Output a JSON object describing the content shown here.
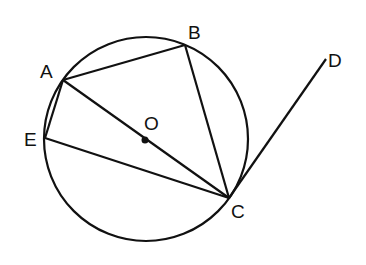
{
  "diagram": {
    "type": "circle-geometry",
    "circle": {
      "center_label": "O",
      "cx": 146,
      "cy": 139,
      "r": 102
    },
    "points": {
      "A": {
        "x": 63,
        "y": 80,
        "label": "A",
        "lx": 40,
        "ly": 78
      },
      "B": {
        "x": 185,
        "y": 45,
        "label": "B",
        "lx": 188,
        "ly": 39
      },
      "C": {
        "x": 229,
        "y": 198,
        "label": "C",
        "lx": 231,
        "ly": 218
      },
      "D": {
        "x": 326,
        "y": 59,
        "label": "D",
        "lx": 328,
        "ly": 67
      },
      "E": {
        "x": 45,
        "y": 138,
        "label": "E",
        "lx": 24,
        "ly": 146
      },
      "O": {
        "x": 145,
        "y": 140,
        "label": "O",
        "lx": 144,
        "ly": 130
      }
    },
    "segments": [
      "AB",
      "BC",
      "AC",
      "AE",
      "EC",
      "CD"
    ],
    "labels": {
      "A": "A",
      "B": "B",
      "C": "C",
      "D": "D",
      "E": "E",
      "O": "O"
    }
  }
}
